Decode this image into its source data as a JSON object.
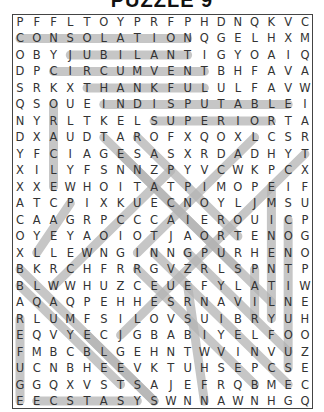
{
  "puzzle": {
    "title": "PUZZLE 9",
    "cols": 18,
    "rows": 24,
    "origin_x": 20,
    "origin_y": 22,
    "step_x": 16.76,
    "step_y": 16.48,
    "highlight_color": "#b3b3b3",
    "grid": [
      "PFFLTOYPRFPHDNQKVC",
      "CONSOLATIONQGELHXM",
      "OBYJUBILANTIGYOAIQ",
      "DPCIRCUMVENTBHFAVA",
      "SRKXTHANKFULULFAVW",
      "QSOUEINDISPUTABLEI",
      "NYRLTKELSUPERIORTA",
      "DXAUDTAROFXQOXLCSR",
      "YFCIAGESASXRDADHYT",
      "XILYFSNNZPYVCWKPCX",
      "XXEWHOITATPIMOPEIF",
      "ATCPIXKUECNOYLJMSU",
      "CAAGRPCCCAIEROUICP",
      "OYEYAOIOTJAORTENOG",
      "XLLEWNGINNGPURHENO",
      "BKRCHFRRGVZRLSPNTP",
      "BLWWHUZCEUEFYLATIW",
      "AQAQPEHHESRNAVILNE",
      "RLUMFSILOVSUIBRYUH",
      "EQVYECJGBABIYELFOO",
      "FMBCBLGEHNTWVINVUZ",
      "UCNBHEEVKTUHSEPCSE",
      "GGQXVSTSAJEFRQBMEC",
      "EECSTASYSWNNAWNHGQ"
    ],
    "found_words": [
      {
        "word": "CONSOLATION",
        "r1": 1,
        "c1": 0,
        "r2": 1,
        "c2": 10
      },
      {
        "word": "JUBILANT",
        "r1": 2,
        "c1": 3,
        "r2": 2,
        "c2": 10
      },
      {
        "word": "CIRCUMVENT",
        "r1": 3,
        "c1": 2,
        "r2": 3,
        "c2": 11
      },
      {
        "word": "THANKFUL",
        "r1": 4,
        "c1": 4,
        "r2": 4,
        "c2": 11
      },
      {
        "word": "INDISPUTABLE",
        "r1": 5,
        "c1": 5,
        "r2": 5,
        "c2": 16
      },
      {
        "word": "SUPERIOR",
        "r1": 6,
        "c1": 8,
        "r2": 6,
        "c2": 15
      },
      {
        "word": "ORACLE",
        "r1": 5,
        "c1": 2,
        "r2": 10,
        "c2": 2
      },
      {
        "word": "EMINENTLY",
        "r1": 10,
        "c1": 15,
        "r2": 18,
        "c2": 15
      },
      {
        "word": "CONTINUOUS",
        "r1": 12,
        "c1": 16,
        "r2": 21,
        "c2": 16
      },
      {
        "word": "PAIR",
        "r1": 15,
        "c1": 14,
        "r2": 18,
        "c2": 14
      },
      {
        "word": "REFUGE",
        "r1": 18,
        "c1": 0,
        "r2": 23,
        "c2": 0
      },
      {
        "word": "ECSTASY",
        "r1": 23,
        "c1": 1,
        "r2": 23,
        "c2": 7
      },
      {
        "word": "TENACIOUS",
        "r1": 7,
        "c1": 5,
        "r2": 15,
        "c2": 13
      },
      {
        "word": "RAPPORT",
        "r1": 7,
        "c1": 7,
        "r2": 13,
        "c2": 13
      },
      {
        "word": "BLAMELESS",
        "r1": 15,
        "c1": 0,
        "r2": 23,
        "c2": 8
      },
      {
        "word": "DIAG-A",
        "r1": 7,
        "c1": 14,
        "r2": 14,
        "c2": 7
      },
      {
        "word": "DIAG-B",
        "r1": 8,
        "c1": 17,
        "r2": 19,
        "c2": 6
      },
      {
        "word": "DIAG-C",
        "r1": 9,
        "c1": 9,
        "r2": 16,
        "c2": 2
      },
      {
        "word": "DIAG-D",
        "r1": 11,
        "c1": 3,
        "r2": 14,
        "c2": 1
      },
      {
        "word": "DIAG-E",
        "r1": 8,
        "c1": 6,
        "r2": 17,
        "c2": 15
      },
      {
        "word": "DIAG-F",
        "r1": 14,
        "c1": 8,
        "r2": 22,
        "c2": 16
      },
      {
        "word": "DIAG-G",
        "r1": 15,
        "c1": 7,
        "r2": 22,
        "c2": 14
      },
      {
        "word": "DIAG-H",
        "r1": 19,
        "c1": 4,
        "r2": 23,
        "c2": 8
      },
      {
        "word": "DIAG-I",
        "r1": 14,
        "c1": 10,
        "r2": 20,
        "c2": 16
      },
      {
        "word": "DIAG-J",
        "r1": 16,
        "c1": 0,
        "r2": 22,
        "c2": 6
      },
      {
        "word": "DIAG-K",
        "r1": 16,
        "c1": 10,
        "r2": 23,
        "c2": 11
      }
    ]
  }
}
